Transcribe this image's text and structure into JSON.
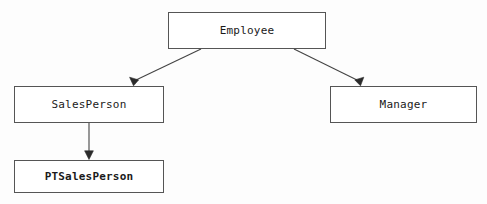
{
  "diagram": {
    "type": "class-inheritance-hierarchy",
    "background_color": "#fdfdfd",
    "line_color": "#444444",
    "box_border_color": "#555555",
    "box_fill_color": "#ffffff",
    "text_color": "#1a1a1a",
    "nodes": [
      {
        "id": "employee",
        "label": "Employee",
        "bold": false
      },
      {
        "id": "salesperson",
        "label": "SalesPerson",
        "bold": false
      },
      {
        "id": "manager",
        "label": "Manager",
        "bold": false
      },
      {
        "id": "ptsalesperson",
        "label": "PTSalesPerson",
        "bold": true
      }
    ],
    "edges": [
      {
        "id": "employee-to-salesperson",
        "from": "employee",
        "to": "salesperson",
        "style": "solid",
        "arrowhead": "filled-triangle"
      },
      {
        "id": "employee-to-manager",
        "from": "employee",
        "to": "manager",
        "style": "solid",
        "arrowhead": "filled-triangle"
      },
      {
        "id": "salesperson-to-ptsalesperson",
        "from": "salesperson",
        "to": "ptsalesperson",
        "style": "solid",
        "arrowhead": "filled-triangle"
      }
    ]
  }
}
